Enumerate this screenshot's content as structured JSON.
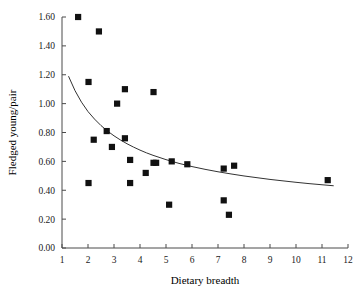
{
  "chart_data": {
    "type": "scatter",
    "title": "",
    "xlabel": "Dietary breadth",
    "ylabel": "Fledged young/pair",
    "xlim": [
      1,
      12
    ],
    "ylim": [
      0.0,
      1.6
    ],
    "xticks": [
      1,
      2,
      3,
      4,
      5,
      6,
      7,
      8,
      9,
      10,
      11,
      12
    ],
    "xtick_labels": [
      "1",
      "2",
      "3",
      "4",
      "5",
      "6",
      "7",
      "8",
      "9",
      "10",
      "11",
      "12"
    ],
    "yticks": [
      0.0,
      0.2,
      0.4,
      0.6,
      0.8,
      1.0,
      1.2,
      1.4,
      1.6
    ],
    "ytick_labels": [
      "0.00",
      "0.20",
      "0.40",
      "0.60",
      "0.80",
      "1.00",
      "1.20",
      "1.40",
      "1.60"
    ],
    "grid": false,
    "legend": null,
    "marker": "filled-square",
    "marker_color": "#111111",
    "points": [
      {
        "x": 1.62,
        "y": 1.6
      },
      {
        "x": 2.42,
        "y": 1.5
      },
      {
        "x": 2.02,
        "y": 1.15
      },
      {
        "x": 3.42,
        "y": 1.1
      },
      {
        "x": 4.52,
        "y": 1.08
      },
      {
        "x": 3.12,
        "y": 1.0
      },
      {
        "x": 2.72,
        "y": 0.81
      },
      {
        "x": 2.22,
        "y": 0.75
      },
      {
        "x": 2.92,
        "y": 0.7
      },
      {
        "x": 3.42,
        "y": 0.76
      },
      {
        "x": 3.62,
        "y": 0.61
      },
      {
        "x": 4.52,
        "y": 0.59
      },
      {
        "x": 4.62,
        "y": 0.59
      },
      {
        "x": 5.22,
        "y": 0.6
      },
      {
        "x": 5.82,
        "y": 0.58
      },
      {
        "x": 7.22,
        "y": 0.55
      },
      {
        "x": 7.62,
        "y": 0.57
      },
      {
        "x": 4.22,
        "y": 0.52
      },
      {
        "x": 2.02,
        "y": 0.45
      },
      {
        "x": 3.62,
        "y": 0.45
      },
      {
        "x": 11.22,
        "y": 0.47
      },
      {
        "x": 5.12,
        "y": 0.3
      },
      {
        "x": 7.22,
        "y": 0.33
      },
      {
        "x": 7.42,
        "y": 0.23
      }
    ],
    "fit_curve": {
      "type": "power-decay",
      "x_start": 1.25,
      "x_end": 11.45,
      "y_start": 1.19,
      "y_end": 0.41,
      "points": [
        {
          "x": 1.25,
          "y": 1.19
        },
        {
          "x": 1.5,
          "y": 1.09
        },
        {
          "x": 1.75,
          "y": 1.01
        },
        {
          "x": 2.0,
          "y": 0.945
        },
        {
          "x": 2.25,
          "y": 0.893
        },
        {
          "x": 2.5,
          "y": 0.848
        },
        {
          "x": 2.75,
          "y": 0.81
        },
        {
          "x": 3.0,
          "y": 0.777
        },
        {
          "x": 3.25,
          "y": 0.748
        },
        {
          "x": 3.5,
          "y": 0.722
        },
        {
          "x": 3.75,
          "y": 0.699
        },
        {
          "x": 4.0,
          "y": 0.678
        },
        {
          "x": 4.25,
          "y": 0.659
        },
        {
          "x": 4.5,
          "y": 0.642
        },
        {
          "x": 5.0,
          "y": 0.612
        },
        {
          "x": 5.5,
          "y": 0.586
        },
        {
          "x": 6.0,
          "y": 0.564
        },
        {
          "x": 6.5,
          "y": 0.545
        },
        {
          "x": 7.0,
          "y": 0.528
        },
        {
          "x": 7.5,
          "y": 0.513
        },
        {
          "x": 8.0,
          "y": 0.499
        },
        {
          "x": 8.5,
          "y": 0.487
        },
        {
          "x": 9.0,
          "y": 0.475
        },
        {
          "x": 9.5,
          "y": 0.465
        },
        {
          "x": 10.0,
          "y": 0.455
        },
        {
          "x": 10.5,
          "y": 0.446
        },
        {
          "x": 11.0,
          "y": 0.438
        },
        {
          "x": 11.45,
          "y": 0.431
        }
      ]
    }
  }
}
